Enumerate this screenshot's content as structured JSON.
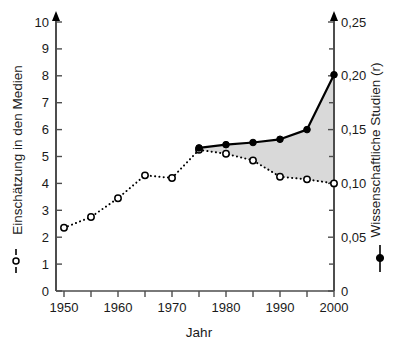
{
  "chart_data": {
    "type": "line",
    "title": "",
    "xlabel": "Jahr",
    "ylabel": "Einschätzung in den Medien",
    "y2label": "Wissenschaftliche Studien (r)",
    "xlim": [
      1950,
      2000
    ],
    "ylim": [
      0,
      10
    ],
    "y2lim": [
      0,
      0.25
    ],
    "grid": false,
    "legend_position": "left-axis-inline",
    "x_ticks": [
      1950,
      1955,
      1960,
      1965,
      1970,
      1975,
      1980,
      1985,
      1990,
      1995,
      2000
    ],
    "x_tick_labels": [
      "1950",
      "",
      "1960",
      "",
      "1970",
      "",
      "1980",
      "",
      "1990",
      "",
      "2000"
    ],
    "y_ticks": [
      0,
      1,
      2,
      3,
      4,
      5,
      6,
      7,
      8,
      9,
      10
    ],
    "y_tick_labels": [
      "0",
      "1",
      "2",
      "3",
      "4",
      "5",
      "6",
      "7",
      "8",
      "9",
      "10"
    ],
    "y2_ticks": [
      0,
      0.025,
      0.05,
      0.075,
      0.1,
      0.125,
      0.15,
      0.175,
      0.2,
      0.225,
      0.25
    ],
    "y2_tick_labels": [
      "0",
      "",
      "0,05",
      "",
      "0,10",
      "",
      "0,15",
      "",
      "0,20",
      "",
      "0,25"
    ],
    "series": [
      {
        "name": "Einschätzung in den Medien",
        "axis": "left",
        "style": "dotted",
        "marker": "open-circle",
        "color": "#000000",
        "x": [
          1950,
          1955,
          1960,
          1965,
          1970,
          1975,
          1980,
          1985,
          1990,
          1995,
          2000
        ],
        "values": [
          2.35,
          2.75,
          3.45,
          4.3,
          4.2,
          5.25,
          5.1,
          4.85,
          4.25,
          4.15,
          4.0
        ]
      },
      {
        "name": "Wissenschaftliche Studien (r)",
        "axis": "right",
        "style": "solid",
        "marker": "filled-circle",
        "color": "#000000",
        "x": [
          1975,
          1980,
          1985,
          1990,
          1995,
          2000
        ],
        "values": [
          0.133,
          0.136,
          0.138,
          0.141,
          0.15,
          0.201
        ],
        "values_left_scale": [
          5.3,
          5.45,
          5.5,
          5.65,
          6.0,
          8.05
        ]
      }
    ],
    "shaded_region": {
      "fill": "#d9d9d9",
      "between": [
        "Wissenschaftliche Studien (r)",
        "Einschätzung in den Medien"
      ],
      "x_start": 1975,
      "x_end": 2000
    }
  },
  "legend": {
    "left_marker": "--o--",
    "right_marker": "filled-circle-bar"
  },
  "icons": {
    "axis_arrow": "arrow-up-icon",
    "open_circle": "open-circle-marker-icon",
    "filled_circle": "filled-circle-marker-icon"
  }
}
